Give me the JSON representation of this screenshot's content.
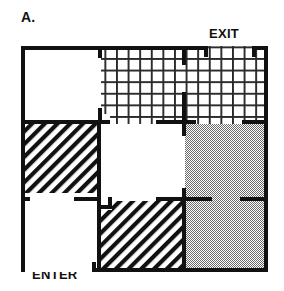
{
  "figure": {
    "panel_label": "A.",
    "type": "maze-floorplan-diagram",
    "entrance_label": "ENTER",
    "exit_label": "EXIT"
  },
  "colors": {
    "wall": "#111111",
    "background": "#ffffff",
    "gray_fill": "#b4b4b4",
    "hatch": "#111111",
    "grid_fill": "#3a3a3a"
  },
  "maze": {
    "bounds": {
      "x": 21,
      "y": 46,
      "width": 247,
      "height": 226
    },
    "columns": [
      {
        "index": 0,
        "x": 21,
        "width": 80
      },
      {
        "index": 1,
        "x": 101,
        "width": 84
      },
      {
        "index": 2,
        "x": 185,
        "width": 83
      }
    ],
    "rows": [
      {
        "index": 0,
        "y": 46,
        "height": 78
      },
      {
        "index": 1,
        "y": 124,
        "height": 77
      },
      {
        "index": 2,
        "y": 201,
        "height": 71
      }
    ],
    "rooms": [
      {
        "id": "r0c0",
        "row": 0,
        "col": 0,
        "fill": "plain"
      },
      {
        "id": "r0c1",
        "row": 0,
        "col": 1,
        "fill": "crosshatch"
      },
      {
        "id": "r0c2",
        "row": 0,
        "col": 2,
        "fill": "crosshatch"
      },
      {
        "id": "r1c0",
        "row": 1,
        "col": 0,
        "fill": "diagonal"
      },
      {
        "id": "r1c1",
        "row": 1,
        "col": 1,
        "fill": "plain"
      },
      {
        "id": "r1c2",
        "row": 1,
        "col": 2,
        "fill": "gray"
      },
      {
        "id": "r2c0",
        "row": 2,
        "col": 0,
        "fill": "plain"
      },
      {
        "id": "r2c1",
        "row": 2,
        "col": 1,
        "fill": "diagonal"
      },
      {
        "id": "r2c2",
        "row": 2,
        "col": 2,
        "fill": "gray"
      }
    ],
    "openings": [
      {
        "id": "exit-opening",
        "wall": "top",
        "x1": 208,
        "x2": 252
      },
      {
        "id": "enter-opening",
        "wall": "bottom",
        "x1": 28,
        "x2": 96
      },
      {
        "id": "door-top-mid-left",
        "wall": "vertical-col0-col1-row0",
        "y1": 58,
        "y2": 108
      },
      {
        "id": "door-top-mid-right",
        "wall": "vertical-col1-col2-row0",
        "y1": 65,
        "y2": 92
      },
      {
        "id": "door-row0-row1-col1",
        "wall": "horizontal-row0-row1-col1",
        "x1": 110,
        "x2": 156
      },
      {
        "id": "door-row0-row1-col2",
        "wall": "horizontal-row0-row1-col2",
        "x1": 196,
        "x2": 242
      },
      {
        "id": "door-row1-col1-col2",
        "wall": "vertical-col1-col2-row1",
        "y1": 134,
        "y2": 190
      },
      {
        "id": "door-row1-row2-col0",
        "wall": "horizontal-row1-row2-col0",
        "x1": 30,
        "x2": 74
      },
      {
        "id": "door-row1-row2-col1",
        "wall": "horizontal-row1-row2-col1",
        "x1": 112,
        "x2": 156
      },
      {
        "id": "door-row2-col2-inner",
        "wall": "horizontal-row1-row2-col2",
        "x1": 212,
        "x2": 240
      }
    ]
  }
}
